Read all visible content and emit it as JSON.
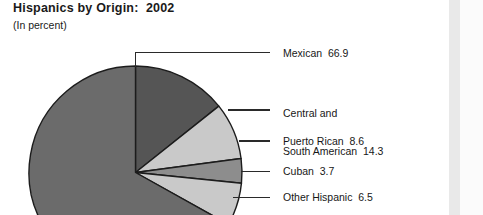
{
  "header": {
    "title": "Hispanics by Origin:  2002",
    "subtitle": "(In percent)"
  },
  "colors": {
    "mexican": "#6b6b6b",
    "central_south_american": "#555555",
    "puerto_rican": "#c9c9c9",
    "cuban": "#8d8d8d",
    "other_hispanic": "#c9c9c9",
    "outline": "#1c1c1c",
    "leader_line": "#2a2a2a",
    "edge_band": "#e9e9e9"
  },
  "labels": {
    "mexican": "Mexican  66.9",
    "central_south_american_line1": "Central and",
    "central_south_american_line2": "South American  14.3",
    "puerto_rican": "Puerto Rican  8.6",
    "cuban": "Cuban  3.7",
    "other_hispanic": "Other Hispanic  6.5"
  },
  "chart_data": {
    "type": "pie",
    "title": "Hispanics by Origin:  2002",
    "subtitle": "(In percent)",
    "unit": "percent",
    "categories": [
      "Mexican",
      "Central and South American",
      "Puerto Rican",
      "Cuban",
      "Other Hispanic"
    ],
    "values": [
      66.9,
      14.3,
      8.6,
      3.7,
      6.5
    ],
    "start_angle_deg": 0,
    "direction": "clockwise",
    "slice_order_clockwise_from_top": [
      "Central and South American",
      "Puerto Rican",
      "Cuban",
      "Other Hispanic",
      "Mexican"
    ],
    "legend": "callout-labels-right",
    "grid": false,
    "xlabel": "",
    "ylabel": ""
  }
}
